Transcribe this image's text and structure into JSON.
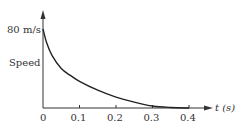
{
  "chart_data": {
    "type": "line",
    "title": "",
    "xlabel": "t (s)",
    "ylabel": "Speed",
    "y_annotation": "80 m/s",
    "x_ticks": [
      "0",
      "0.1",
      "0.2",
      "0.3",
      "0.4"
    ],
    "xlim": [
      0,
      0.45
    ],
    "ylim": [
      0,
      95
    ],
    "grid": false,
    "series": [
      {
        "name": "speed",
        "x": [
          0,
          0.01,
          0.025,
          0.05,
          0.075,
          0.1,
          0.15,
          0.2,
          0.25,
          0.3,
          0.35,
          0.4
        ],
        "values": [
          80,
          66,
          53,
          40,
          33,
          27,
          18,
          11,
          6,
          2,
          0.5,
          0
        ]
      }
    ]
  },
  "labels": {
    "y_value": "80 m/s",
    "y_axis": "Speed",
    "x_axis": "t (s)",
    "ticks": [
      "0",
      "0.1",
      "0.2",
      "0.3",
      "0.4"
    ]
  }
}
